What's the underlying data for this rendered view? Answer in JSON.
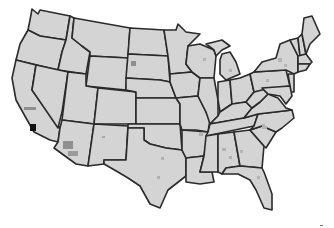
{
  "map": {
    "title": "",
    "type": "choropleth",
    "region": "United States (contiguous)",
    "colors": {
      "background": "#ffffff",
      "base_fill": "#d4d4d4",
      "border": "#2a2a2a",
      "light_highlight": "#b4b4b4",
      "medium_highlight": "#8f8f8f",
      "dark_highlight": "#111111"
    },
    "highlights": [
      {
        "area": "southern California county",
        "level": "dark"
      },
      {
        "area": "central California",
        "level": "medium"
      },
      {
        "area": "central Arizona",
        "level": "medium"
      },
      {
        "area": "southern Arizona",
        "level": "medium"
      },
      {
        "area": "western South Dakota",
        "level": "medium"
      },
      {
        "area": "New Mexico",
        "level": "light"
      },
      {
        "area": "Texas",
        "level": "light"
      },
      {
        "area": "Alabama",
        "level": "light"
      },
      {
        "area": "Georgia",
        "level": "light"
      },
      {
        "area": "North Carolina",
        "level": "light"
      },
      {
        "area": "South Carolina",
        "level": "light"
      },
      {
        "area": "Florida",
        "level": "light"
      },
      {
        "area": "Arkansas",
        "level": "light"
      },
      {
        "area": "Wisconsin",
        "level": "light"
      },
      {
        "area": "Michigan",
        "level": "light"
      },
      {
        "area": "Pennsylvania",
        "level": "light"
      },
      {
        "area": "New York",
        "level": "light"
      }
    ],
    "legend": null
  }
}
